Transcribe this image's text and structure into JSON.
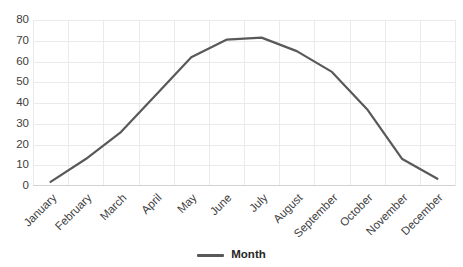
{
  "chart_data": {
    "type": "line",
    "title": "",
    "subtitle": "",
    "xlabel": "",
    "ylabel": "",
    "categories": [
      "January",
      "February",
      "March",
      "April",
      "May",
      "June",
      "July",
      "August",
      "September",
      "October",
      "November",
      "December"
    ],
    "series": [
      {
        "name": "Month",
        "color": "#595959",
        "values": [
          2,
          13,
          26,
          44,
          62,
          70.5,
          71.5,
          65,
          55,
          37,
          13,
          3.5
        ]
      }
    ],
    "ylim": [
      0,
      80
    ],
    "y_ticks": [
      0,
      10,
      20,
      30,
      40,
      50,
      60,
      70,
      80
    ],
    "y_tick_labels": [
      "0",
      "10",
      "20",
      "30",
      "40",
      "50",
      "60",
      "70",
      "80"
    ],
    "grid": true,
    "grid_color": "#e8eaec",
    "gridlines_horizontal": true,
    "gridlines_vertical": true,
    "legend": {
      "position": "bottom",
      "entries": [
        {
          "label": "Month",
          "color": "#595959",
          "marker": "line"
        }
      ]
    },
    "x_label_rotation_degrees": -45,
    "background_color": "#ffffff",
    "axis_text_color": "#404040"
  },
  "legend": {
    "month_label": "Month"
  }
}
